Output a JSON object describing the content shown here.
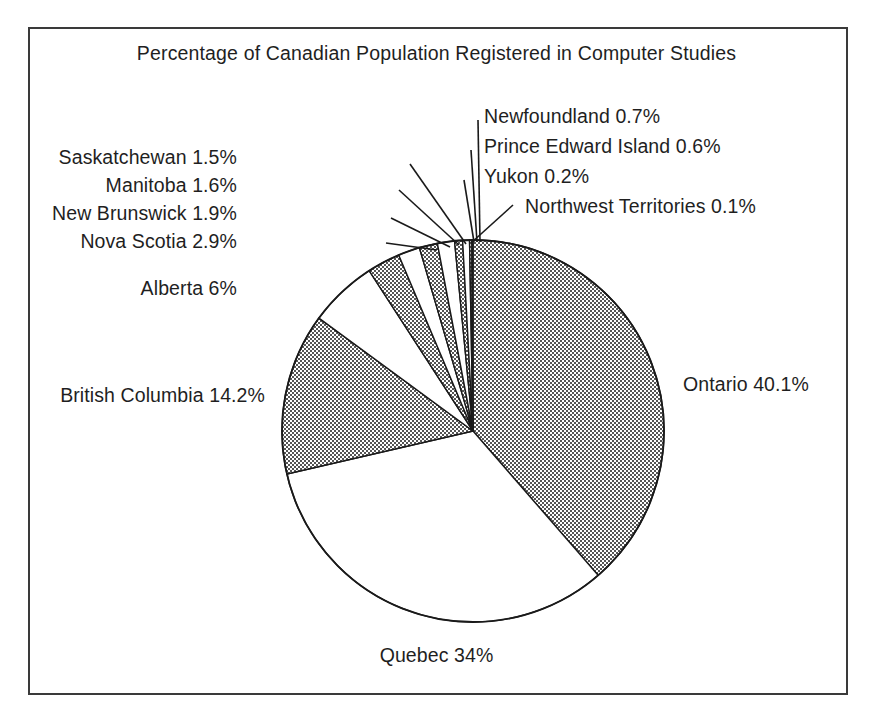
{
  "chart_data": {
    "type": "pie",
    "title": "Percentage of Canadian Population Registered in Computer Studies",
    "xlabel": "",
    "ylabel": "",
    "legend": "none",
    "grid": false,
    "units": "percent",
    "start_angle_deg": 0,
    "direction": "clockwise",
    "categories": [
      "Ontario",
      "Quebec",
      "British Columbia",
      "Alberta",
      "Nova Scotia",
      "New Brunswick",
      "Manitoba",
      "Saskatchewan",
      "Newfoundland",
      "Prince Edward Island",
      "Yukon",
      "Northwest Territories"
    ],
    "values": [
      40.1,
      34,
      14.2,
      6,
      2.9,
      1.9,
      1.6,
      1.5,
      0.7,
      0.6,
      0.2,
      0.1
    ],
    "slices": [
      {
        "name": "Ontario",
        "value": 40.1,
        "label": "Ontario 40.1%",
        "fill": "hatch"
      },
      {
        "name": "Quebec",
        "value": 34,
        "label": "Quebec 34%",
        "fill": "white"
      },
      {
        "name": "British Columbia",
        "value": 14.2,
        "label": "British Columbia 14.2%",
        "fill": "hatch"
      },
      {
        "name": "Alberta",
        "value": 6,
        "label": "Alberta 6%",
        "fill": "white"
      },
      {
        "name": "Nova Scotia",
        "value": 2.9,
        "label": "Nova Scotia 2.9%",
        "fill": "hatch"
      },
      {
        "name": "New Brunswick",
        "value": 1.9,
        "label": "New Brunswick 1.9%",
        "fill": "white"
      },
      {
        "name": "Manitoba",
        "value": 1.6,
        "label": "Manitoba 1.6%",
        "fill": "hatch"
      },
      {
        "name": "Saskatchewan",
        "value": 1.5,
        "label": "Saskatchewan 1.5%",
        "fill": "white"
      },
      {
        "name": "Newfoundland",
        "value": 0.7,
        "label": "Newfoundland 0.7%",
        "fill": "hatch"
      },
      {
        "name": "Prince Edward Island",
        "value": 0.6,
        "label": "Prince Edward Island 0.6%",
        "fill": "white"
      },
      {
        "name": "Yukon",
        "value": 0.2,
        "label": "Yukon 0.2%",
        "fill": "hatch"
      },
      {
        "name": "Northwest Territories",
        "value": 0.1,
        "label": "Northwest Territories 0.1%",
        "fill": "white"
      }
    ],
    "colors": {
      "hatch_fill": "#9a9a9a",
      "white_fill": "#ffffff",
      "outline": "#1a1a1a",
      "frame": "#3a3a3a",
      "text": "#1f1f1f",
      "background": "#ffffff"
    }
  }
}
